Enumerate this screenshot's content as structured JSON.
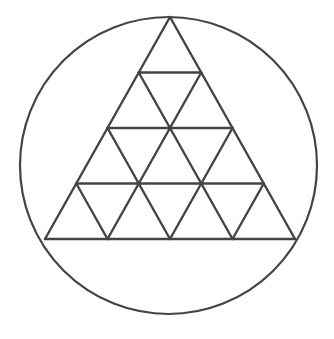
{
  "figure": {
    "stroke_color": "#444444",
    "background": "#ffffff",
    "circle": {
      "cx": 168.5,
      "cy": 165.5,
      "r": 148.5,
      "stroke_width": 2.2
    },
    "triangle": {
      "apex": [
        170,
        17
      ],
      "base_left": [
        45,
        239
      ],
      "base_right": [
        295,
        239
      ],
      "rows": 4,
      "stroke_width": 2.4
    }
  }
}
